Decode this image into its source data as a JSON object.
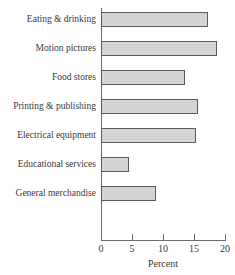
{
  "chart_data": {
    "type": "bar",
    "orientation": "horizontal",
    "title": "",
    "xlabel": "Percent",
    "ylabel": "",
    "xlim": [
      0,
      20
    ],
    "xticks": [
      0,
      5,
      10,
      15,
      20
    ],
    "xtick_labels": [
      "0",
      "5",
      "10",
      "15",
      "20"
    ],
    "grid": false,
    "legend": null,
    "categories": [
      "Eating & drinking",
      "Motion pictures",
      "Food stores",
      "Printing & publishing",
      "Electrical equipment",
      "Educational services",
      "General merchandise"
    ],
    "values": [
      17.2,
      18.7,
      13.5,
      15.7,
      15.4,
      4.5,
      8.8
    ],
    "bars": [
      {
        "label": "Eating & drinking",
        "value": 17.2
      },
      {
        "label": "Motion pictures",
        "value": 18.7
      },
      {
        "label": "Food stores",
        "value": 13.5
      },
      {
        "label": "Printing & publishing",
        "value": 15.7
      },
      {
        "label": "Electrical equipment",
        "value": 15.4
      },
      {
        "label": "Educational services",
        "value": 4.5
      },
      {
        "label": "General merchandise",
        "value": 8.8
      }
    ],
    "colors": {
      "bar_fill": "#d4d4d4",
      "bar_border": "#5a5a5a",
      "axis": "#6b6b6b",
      "text": "#3a3a3a",
      "background": "#ffffff"
    }
  }
}
